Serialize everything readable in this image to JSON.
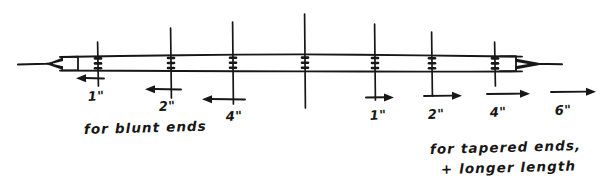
{
  "figure": {
    "ink_color": "#171717",
    "background_color": "#ffffff"
  },
  "rod": {
    "name": "rod",
    "axis_y": 64,
    "left_tip_x": 18,
    "right_tip_x": 562,
    "body_left_x": 60,
    "body_right_x": 522,
    "body_top_y": 54,
    "body_bottom_y": 72,
    "left_end_style": "tapered-arrow-left",
    "right_end_style": "tapered-arrow-right"
  },
  "tick_marks": [
    {
      "id": "tick-1",
      "x": 98,
      "top_y": 42,
      "bottom_y": 86
    },
    {
      "id": "tick-2",
      "x": 171,
      "top_y": 28,
      "bottom_y": 98
    },
    {
      "id": "tick-3",
      "x": 233,
      "top_y": 22,
      "bottom_y": 104
    },
    {
      "id": "tick-4",
      "x": 305,
      "top_y": 14,
      "bottom_y": 108
    },
    {
      "id": "tick-5",
      "x": 375,
      "top_y": 24,
      "bottom_y": 100
    },
    {
      "id": "tick-6",
      "x": 432,
      "top_y": 32,
      "bottom_y": 96
    },
    {
      "id": "tick-7",
      "x": 495,
      "top_y": 42,
      "bottom_y": 86
    }
  ],
  "dimensions": {
    "left_group": {
      "caption": "for blunt ends",
      "caption_x": 84,
      "caption_y": 133,
      "arrow_direction": "left",
      "items": [
        {
          "label": "1\"",
          "arrow_x1": 104,
          "arrow_x2": 80,
          "arrow_y": 78,
          "label_x": 90,
          "label_y": 100
        },
        {
          "label": "2\"",
          "arrow_x1": 180,
          "arrow_x2": 148,
          "arrow_y": 89,
          "label_x": 161,
          "label_y": 110
        },
        {
          "label": "4\"",
          "arrow_x1": 244,
          "arrow_x2": 204,
          "arrow_y": 99,
          "label_x": 228,
          "label_y": 119
        }
      ]
    },
    "right_group": {
      "caption_line1": "for tapered ends,",
      "caption_line2": "+ longer length",
      "caption_x": 432,
      "caption_y1": 153,
      "caption_y2": 172,
      "arrow_direction": "right",
      "items": [
        {
          "label": "1\"",
          "arrow_x1": 368,
          "arrow_x2": 394,
          "arrow_y": 97,
          "label_x": 371,
          "label_y": 119
        },
        {
          "label": "2\"",
          "arrow_x1": 425,
          "arrow_x2": 462,
          "arrow_y": 96,
          "label_x": 429,
          "label_y": 118
        },
        {
          "label": "4\"",
          "arrow_x1": 488,
          "arrow_x2": 530,
          "arrow_y": 94,
          "label_x": 491,
          "label_y": 116
        },
        {
          "label": "6\"",
          "arrow_x1": 552,
          "arrow_x2": 596,
          "arrow_y": 92,
          "label_x": 556,
          "label_y": 114
        }
      ]
    }
  }
}
